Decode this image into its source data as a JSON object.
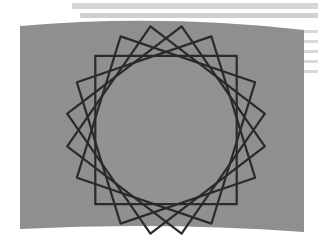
{
  "scene": {
    "description": "CRT-style gray screen displaying a rosette of rotated squares",
    "background_color": "#ffffff",
    "screen_color": "#8e8e8e",
    "line_color": "#2a2a2a",
    "stripe_color": "#d4d4d4"
  },
  "figure": {
    "shape": "square",
    "count": 5,
    "rotation_step_deg": 18,
    "rotation_offset_deg": 9,
    "center": [
      166,
      130
    ],
    "radius_x": 100,
    "radius_y": 105,
    "inner_circle_radius": 72
  }
}
